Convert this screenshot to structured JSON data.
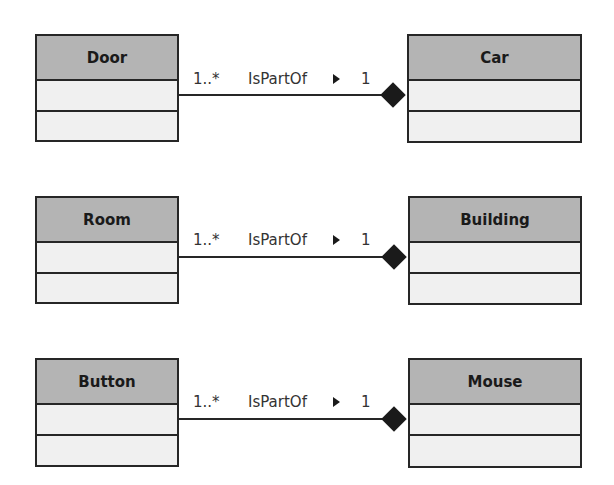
{
  "diagram": {
    "type": "UML class diagram - composition associations",
    "colors": {
      "header_fill": "#b4b4b4",
      "body_fill": "#f0f0f0",
      "line": "#262626",
      "diamond": "#1a1a1a"
    },
    "rows": [
      {
        "part": {
          "name": "Door"
        },
        "whole": {
          "name": "Car"
        },
        "association": {
          "part_multiplicity": "1..*",
          "name": "IsPartOf",
          "direction_icon": "triangle-right-icon",
          "whole_multiplicity": "1",
          "kind": "composition"
        }
      },
      {
        "part": {
          "name": "Room"
        },
        "whole": {
          "name": "Building"
        },
        "association": {
          "part_multiplicity": "1..*",
          "name": "IsPartOf",
          "direction_icon": "triangle-right-icon",
          "whole_multiplicity": "1",
          "kind": "composition"
        }
      },
      {
        "part": {
          "name": "Button"
        },
        "whole": {
          "name": "Mouse"
        },
        "association": {
          "part_multiplicity": "1..*",
          "name": "IsPartOf",
          "direction_icon": "triangle-right-icon",
          "whole_multiplicity": "1",
          "kind": "composition"
        }
      }
    ]
  }
}
